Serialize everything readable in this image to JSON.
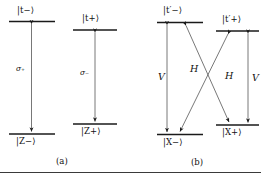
{
  "figure": {
    "caption_a": "(a)",
    "caption_b": "(b)",
    "line_color": "#1a1a1a",
    "text_color": "#111111",
    "background": "#ffffff"
  },
  "panel_a": {
    "name": "(a)",
    "transitions": [
      {
        "id": "a-left",
        "upper_state": "|t−⟩",
        "lower_state": "|Z−⟩",
        "coupling_label": "σ₊",
        "arrow": "double-headed-vertical"
      },
      {
        "id": "a-right",
        "upper_state": "|t+⟩",
        "lower_state": "|Z+⟩",
        "coupling_label": "σ₋",
        "arrow": "double-headed-vertical"
      }
    ]
  },
  "panel_b": {
    "name": "(b)",
    "states": {
      "upper_left": "|t′−⟩",
      "upper_right": "|t′+⟩",
      "lower_left": "|X−⟩",
      "lower_right": "|X+⟩"
    },
    "transitions": [
      {
        "id": "b-vertical-left",
        "from": "|t′−⟩",
        "to": "|X−⟩",
        "coupling_label": "V",
        "arrow": "double-headed-vertical"
      },
      {
        "id": "b-diagonal-left",
        "from": "|t′−⟩",
        "to": "|X+⟩",
        "coupling_label": "H",
        "arrow": "double-headed-diagonal"
      },
      {
        "id": "b-diagonal-right",
        "from": "|t′+⟩",
        "to": "|X−⟩",
        "coupling_label": "H",
        "arrow": "double-headed-diagonal"
      },
      {
        "id": "b-vertical-right",
        "from": "|t′+⟩",
        "to": "|X+⟩",
        "coupling_label": "V",
        "arrow": "double-headed-vertical"
      }
    ]
  }
}
